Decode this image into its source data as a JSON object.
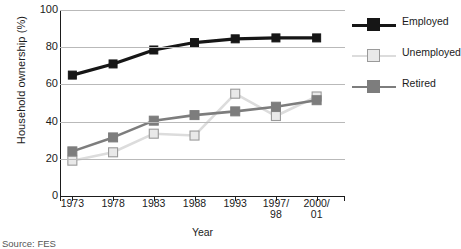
{
  "chart_data": {
    "type": "line",
    "title": "",
    "xlabel": "Year",
    "ylabel": "Household ownership (%)",
    "categories": [
      "1973",
      "1978",
      "1983",
      "1988",
      "1993",
      "1997/\n98",
      "2000/\n01"
    ],
    "categories_multiline": [
      [
        "1973"
      ],
      [
        "1978"
      ],
      [
        "1983"
      ],
      [
        "1988"
      ],
      [
        "1993"
      ],
      [
        "1997/",
        "98"
      ],
      [
        "2000/",
        "01"
      ]
    ],
    "ylim": [
      0,
      100
    ],
    "yticks": [
      0,
      20,
      40,
      60,
      80,
      100
    ],
    "grid": true,
    "legend_position": "right",
    "series": [
      {
        "name": "Employed",
        "color": "#161616",
        "marker": "square-filled",
        "values": [
          65,
          71,
          78.5,
          82.5,
          84.5,
          85,
          85
        ]
      },
      {
        "name": "Unemployed",
        "color": "#dcdcdc",
        "marker": "square-open",
        "values": [
          19,
          23.5,
          33.5,
          32.5,
          55,
          43,
          53.5
        ]
      },
      {
        "name": "Retired",
        "color": "#7d7d7d",
        "marker": "square-filled",
        "values": [
          24,
          31.5,
          40.5,
          43.5,
          45.5,
          48,
          51.5
        ]
      }
    ]
  },
  "axis": {
    "ylabel": "Household ownership (%)",
    "xlabel": "Year",
    "ytick_labels": [
      "100",
      "80",
      "60",
      "40",
      "20",
      "0"
    ]
  },
  "legend": {
    "items": [
      {
        "label": "Employed"
      },
      {
        "label": "Unemployed"
      },
      {
        "label": "Retired"
      }
    ]
  },
  "footer": {
    "source": "Source: FES"
  }
}
